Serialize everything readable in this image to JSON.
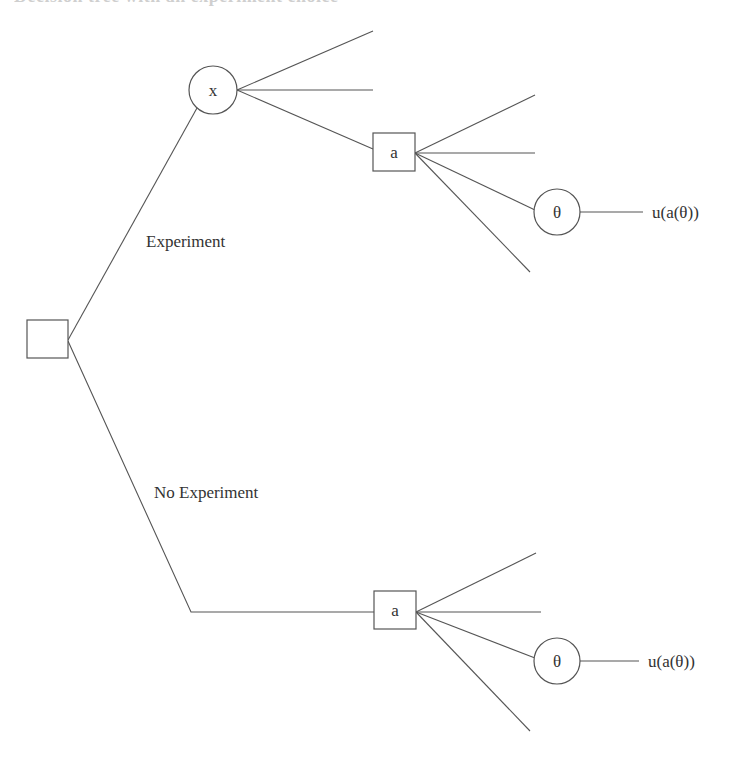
{
  "header": {
    "clipped_title": "Decision tree with an experiment choice"
  },
  "branches": {
    "experiment_label": "Experiment",
    "no_experiment_label": "No Experiment"
  },
  "nodes": {
    "root": {
      "type": "decision",
      "label": ""
    },
    "observation": {
      "type": "chance",
      "label": "x"
    },
    "action_experiment": {
      "type": "decision",
      "label": "a"
    },
    "state_experiment": {
      "type": "chance",
      "label": "θ"
    },
    "action_no_experiment": {
      "type": "decision",
      "label": "a"
    },
    "state_no_experiment": {
      "type": "chance",
      "label": "θ"
    }
  },
  "outcomes": {
    "experiment_utility": "u(a(θ))",
    "no_experiment_utility": "u(a(θ))"
  },
  "colors": {
    "line": "#555555",
    "text": "#333333",
    "background": "#ffffff"
  }
}
